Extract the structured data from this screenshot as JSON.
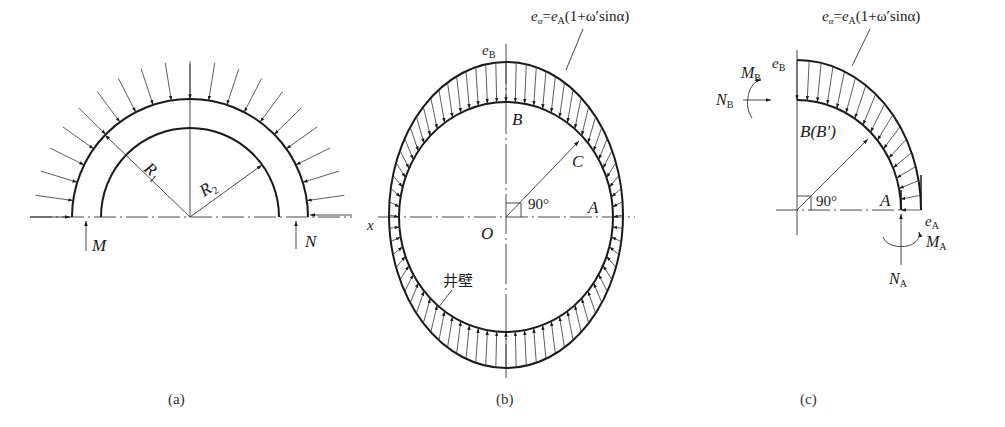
{
  "figure": {
    "panels": [
      {
        "id": "a",
        "caption": "(a)",
        "labels": {
          "outer_radius": "R",
          "outer_radius_sub": "1",
          "inner_radius": "R",
          "inner_radius_sub": "2",
          "left_support": "M",
          "right_support": "N"
        }
      },
      {
        "id": "b",
        "caption": "(b)",
        "labels": {
          "formula_lhs": "e",
          "formula_lhs_sub": "α",
          "formula_eq": "=",
          "formula_rhs_e": "e",
          "formula_rhs_sub": "A",
          "formula_rhs_rest": "(1+ω′sinα)",
          "top_pressure": "e",
          "top_pressure_sub": "B",
          "point_b": "B",
          "point_c": "C",
          "point_a": "A",
          "origin": "O",
          "axis_x": "x",
          "angle": "90°",
          "wall_label": "井壁"
        }
      },
      {
        "id": "c",
        "caption": "(c)",
        "labels": {
          "formula_lhs": "e",
          "formula_lhs_sub": "α",
          "formula_eq": "=",
          "formula_rhs_e": "e",
          "formula_rhs_sub": "A",
          "formula_rhs_rest": "(1+ω′sinα)",
          "top_pressure": "e",
          "top_pressure_sub": "B",
          "moment_b": "M",
          "moment_b_sub": "B",
          "force_b": "N",
          "force_b_sub": "B",
          "point_b": "B(B′)",
          "angle": "90°",
          "point_a": "A",
          "side_pressure": "e",
          "side_pressure_sub": "A",
          "moment_a": "M",
          "moment_a_sub": "A",
          "force_a": "N",
          "force_a_sub": "A"
        }
      }
    ]
  }
}
